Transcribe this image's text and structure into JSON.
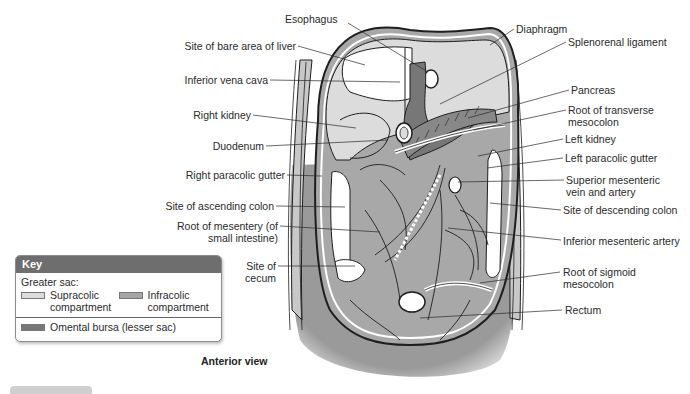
{
  "figure": {
    "caption": "Anterior view",
    "colors": {
      "supracolic": "#dcdcdc",
      "infracolic": "#a6a6a6",
      "omental_bursa": "#777777",
      "key_header": "#6e6e6e",
      "outline": "#1e1e1e"
    }
  },
  "labels_left": [
    {
      "id": "site-of-bare-area-of-liver",
      "text": "Site of bare area of liver"
    },
    {
      "id": "inferior-vena-cava",
      "text": "Inferior vena cava"
    },
    {
      "id": "right-kidney",
      "text": "Right kidney"
    },
    {
      "id": "duodenum",
      "text": "Duodenum"
    },
    {
      "id": "right-paracolic-gutter",
      "text": "Right paracolic gutter"
    },
    {
      "id": "site-of-ascending-colon",
      "text": "Site of ascending colon"
    },
    {
      "id": "root-of-mesentery",
      "text": "Root of mesentery (of small intestine)"
    },
    {
      "id": "site-of-cecum",
      "text": "Site of cecum"
    }
  ],
  "labels_top": [
    {
      "id": "esophagus",
      "text": "Esophagus"
    }
  ],
  "labels_right": [
    {
      "id": "diaphragm",
      "text": "Diaphragm"
    },
    {
      "id": "splenorenal-ligament",
      "text": "Splenorenal ligament"
    },
    {
      "id": "pancreas",
      "text": "Pancreas"
    },
    {
      "id": "root-of-transverse-mesocolon",
      "text": "Root of transverse mesocolon"
    },
    {
      "id": "left-kidney",
      "text": "Left kidney"
    },
    {
      "id": "left-paracolic-gutter",
      "text": "Left paracolic gutter"
    },
    {
      "id": "superior-mesenteric-vein-and-artery",
      "text": "Superior mesenteric vein and artery"
    },
    {
      "id": "site-of-descending-colon",
      "text": "Site of descending colon"
    },
    {
      "id": "inferior-mesenteric-artery",
      "text": "Inferior mesenteric artery"
    },
    {
      "id": "root-of-sigmoid-mesocolon",
      "text": "Root of sigmoid mesocolon"
    },
    {
      "id": "rectum",
      "text": "Rectum"
    }
  ],
  "key": {
    "title": "Key",
    "group_label": "Greater sac:",
    "items": [
      {
        "name": "supracolic",
        "line1": "Supracolic",
        "line2": "compartment"
      },
      {
        "name": "infracolic",
        "line1": "Infracolic",
        "line2": "compartment"
      },
      {
        "name": "omental-bursa",
        "line1": "Omental bursa (lesser sac)"
      }
    ]
  }
}
